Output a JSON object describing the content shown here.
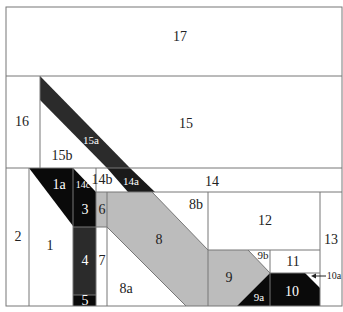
{
  "diagram": {
    "type": "quilt-block-piecing-diagram",
    "colors": {
      "dark": "#0a0a0a",
      "darkgray": "#2b2b2b",
      "gray": "#bcbcbc",
      "white": "#ffffff",
      "line": "#777777"
    },
    "pieces": [
      {
        "id": "17",
        "label": "17",
        "fill": "white"
      },
      {
        "id": "16",
        "label": "16",
        "fill": "white"
      },
      {
        "id": "15",
        "label": "15",
        "fill": "white"
      },
      {
        "id": "15a",
        "label": "15a",
        "fill": "dark"
      },
      {
        "id": "15b",
        "label": "15b",
        "fill": "white"
      },
      {
        "id": "14",
        "label": "14",
        "fill": "white"
      },
      {
        "id": "14a",
        "label": "14a",
        "fill": "dark"
      },
      {
        "id": "14b",
        "label": "14b",
        "fill": "white"
      },
      {
        "id": "14c",
        "label": "14c",
        "fill": "dark"
      },
      {
        "id": "13",
        "label": "13",
        "fill": "white"
      },
      {
        "id": "12",
        "label": "12",
        "fill": "white"
      },
      {
        "id": "11",
        "label": "11",
        "fill": "white"
      },
      {
        "id": "10",
        "label": "10",
        "fill": "dark"
      },
      {
        "id": "10a",
        "label": "10a",
        "fill": "white"
      },
      {
        "id": "9",
        "label": "9",
        "fill": "gray"
      },
      {
        "id": "9a",
        "label": "9a",
        "fill": "dark"
      },
      {
        "id": "9b",
        "label": "9b",
        "fill": "white"
      },
      {
        "id": "8",
        "label": "8",
        "fill": "gray"
      },
      {
        "id": "8a",
        "label": "8a",
        "fill": "white"
      },
      {
        "id": "8b",
        "label": "8b",
        "fill": "white"
      },
      {
        "id": "7",
        "label": "7",
        "fill": "white"
      },
      {
        "id": "6",
        "label": "6",
        "fill": "gray"
      },
      {
        "id": "5",
        "label": "5",
        "fill": "dark"
      },
      {
        "id": "4",
        "label": "4",
        "fill": "darkgray"
      },
      {
        "id": "3",
        "label": "3",
        "fill": "dark"
      },
      {
        "id": "2",
        "label": "2",
        "fill": "white"
      },
      {
        "id": "1",
        "label": "1",
        "fill": "white"
      },
      {
        "id": "1a",
        "label": "1a",
        "fill": "dark"
      }
    ],
    "labels": {
      "p17": "17",
      "p16": "16",
      "p15": "15",
      "p15a": "15a",
      "p15b": "15b",
      "p14": "14",
      "p14a": "14a",
      "p14b": "14b",
      "p14c": "14c",
      "p13": "13",
      "p12": "12",
      "p11": "11",
      "p10": "10",
      "p10a": "10a",
      "p9": "9",
      "p9a": "9a",
      "p9b": "9b",
      "p8": "8",
      "p8a": "8a",
      "p8b": "8b",
      "p7": "7",
      "p6": "6",
      "p5": "5",
      "p4": "4",
      "p3": "3",
      "p2": "2",
      "p1": "1",
      "p1a": "1a"
    }
  }
}
